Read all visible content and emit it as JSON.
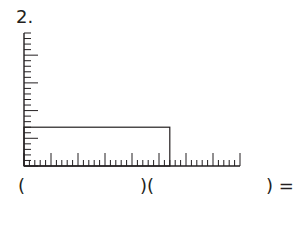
{
  "problem": {
    "number_label": "2.",
    "expression": {
      "open1": "(",
      "mid": ")(",
      "close_eq": ") ="
    }
  },
  "diagram": {
    "type": "area-rectangle-on-rulers",
    "vertical_ruler": {
      "x": 24,
      "y_top": 33,
      "y_bottom": 166,
      "intervals": 24,
      "long_every": 5
    },
    "horizontal_ruler": {
      "y": 166,
      "x_left": 24,
      "x_right": 240,
      "intervals": 40,
      "long_every": 5
    },
    "rectangle": {
      "width_units": 27,
      "height_units": 7
    },
    "stroke_color": "#231f20"
  }
}
